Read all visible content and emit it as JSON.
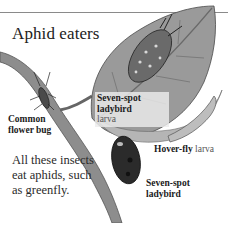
{
  "title": "Aphid eaters",
  "labels": {
    "ladybird_larva": {
      "bold": "Seven-spot ladybird",
      "light": "larva"
    },
    "flower_bug": {
      "bold": "Common flower bug",
      "light": ""
    },
    "hoverfly_larva": {
      "bold": "Hover-fly",
      "light": "larva"
    },
    "ladybird": {
      "bold": "Seven-spot ladybird",
      "light": ""
    }
  },
  "caption": "All these insects eat aphids, such as greenfly.",
  "colors": {
    "rule": "#8a8a8a",
    "leaf": "#8c8c8c",
    "leaf_dark": "#5e5e5e",
    "stem": "#7a7a7a",
    "ladybird": "#2b2b2b"
  }
}
